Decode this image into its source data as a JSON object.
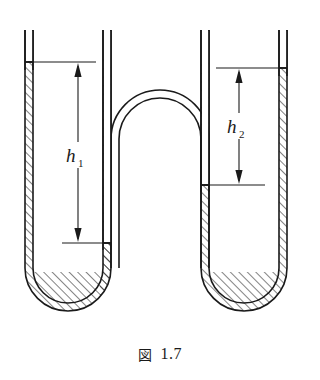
{
  "figure": {
    "caption_label": "図",
    "caption_number": "1.7",
    "caption_full": "図 1.7",
    "type": "double-u-tube-manometer-diagram",
    "background_color": "#ffffff",
    "line_color": "#1a1a1a",
    "hatch_color": "#1a1a1a"
  },
  "annotations": {
    "h1": {
      "label": "h",
      "subscript": "1",
      "text": "h₁",
      "description": "height difference in left u-tube",
      "arrow_top_y": 62,
      "arrow_bottom_y": 243,
      "arrow_x": 78
    },
    "h2": {
      "label": "h",
      "subscript": "2",
      "text": "h₂",
      "description": "height difference in right u-tube",
      "arrow_top_y": 68,
      "arrow_bottom_y": 185,
      "arrow_x": 239
    }
  },
  "tubes": {
    "left": {
      "name": "left-u-tube",
      "outer_fluid_level_y": 62,
      "inner_fluid_level_y": 243
    },
    "right": {
      "name": "right-u-tube",
      "outer_fluid_level_y": 68,
      "inner_fluid_level_y": 185
    },
    "center": {
      "name": "center-inverted-u-arch"
    }
  }
}
